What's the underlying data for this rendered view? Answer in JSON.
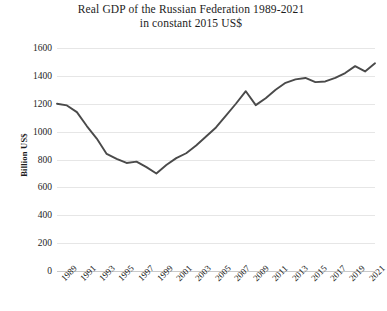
{
  "chart_data": {
    "type": "line",
    "title": "Real GDP of the Russian Federation 1989-2021",
    "subtitle": "in constant 2015 US$",
    "xlabel": "",
    "ylabel": "Billion  US$",
    "ylim": [
      0,
      1600
    ],
    "ytick_labels": [
      "1600",
      "1400",
      "1200",
      "1000",
      "800",
      "600",
      "400",
      "200",
      "0"
    ],
    "ytick_values": [
      1600,
      1400,
      1200,
      1000,
      800,
      600,
      400,
      200,
      0
    ],
    "xtick_labels": [
      "1989",
      "1991",
      "1993",
      "1995",
      "1997",
      "1999",
      "2001",
      "2003",
      "2005",
      "2007",
      "2009",
      "2011",
      "2013",
      "2015",
      "2017",
      "2019",
      "2021"
    ],
    "grid": true,
    "legend": "none",
    "line_color": "#4a4a4a",
    "x": [
      1989,
      1990,
      1991,
      1992,
      1993,
      1994,
      1995,
      1996,
      1997,
      1998,
      1999,
      2000,
      2001,
      2002,
      2003,
      2004,
      2005,
      2006,
      2007,
      2008,
      2009,
      2010,
      2011,
      2012,
      2013,
      2014,
      2015,
      2016,
      2017,
      2018,
      2019,
      2020,
      2021
    ],
    "values": [
      1200,
      1188,
      1140,
      1040,
      950,
      840,
      805,
      775,
      785,
      745,
      700,
      760,
      810,
      845,
      900,
      965,
      1030,
      1115,
      1200,
      1290,
      1190,
      1240,
      1300,
      1350,
      1375,
      1385,
      1355,
      1360,
      1385,
      1420,
      1470,
      1432,
      1490
    ],
    "series": [
      {
        "name": "Real GDP (constant 2015 US$, billions)",
        "values": [
          1200,
          1188,
          1140,
          1040,
          950,
          840,
          805,
          775,
          785,
          745,
          700,
          760,
          810,
          845,
          900,
          965,
          1030,
          1115,
          1200,
          1290,
          1190,
          1240,
          1300,
          1350,
          1375,
          1385,
          1355,
          1360,
          1385,
          1420,
          1470,
          1432,
          1490
        ]
      }
    ],
    "annotations": [
      {
        "label": "peak before transition decline",
        "x": 1989,
        "y": 1200
      },
      {
        "label": "trough of post-Soviet decline",
        "x": 1999,
        "y": 700
      },
      {
        "label": "pre-crisis peak",
        "x": 2008,
        "y": 1290
      },
      {
        "label": "global financial crisis drop",
        "x": 2009,
        "y": 1190
      },
      {
        "label": "pandemic dip",
        "x": 2020,
        "y": 1432
      },
      {
        "label": "final value",
        "x": 2021,
        "y": 1490
      }
    ]
  },
  "axis_geometry": {
    "plot_left": 57,
    "plot_right": 375,
    "y_top_px": 48,
    "y_bottom_px": 271
  }
}
